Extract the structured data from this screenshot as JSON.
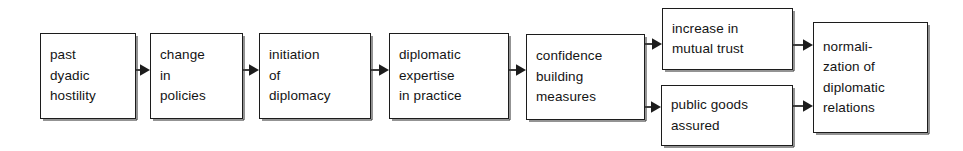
{
  "diagram": {
    "type": "flowchart",
    "orientation": "left-to-right",
    "background_color": "#ffffff",
    "stroke_color": "#1c1c1c",
    "text_color": "#141414",
    "nodes": [
      {
        "id": "past-dyadic-hostility",
        "lines": [
          "past",
          "dyadic",
          "hostility"
        ],
        "x": 40,
        "y": 33,
        "w": 96,
        "h": 86
      },
      {
        "id": "change-in-policies",
        "lines": [
          "change",
          "in",
          "policies"
        ],
        "x": 150,
        "y": 33,
        "w": 93,
        "h": 86
      },
      {
        "id": "initiation-of-diplomacy",
        "lines": [
          "initiation",
          "of",
          "diplomacy"
        ],
        "x": 259,
        "y": 33,
        "w": 112,
        "h": 86
      },
      {
        "id": "diplomatic-expertise-in-practice",
        "lines": [
          "diplomatic",
          "expertise",
          "in practice"
        ],
        "x": 389,
        "y": 33,
        "w": 120,
        "h": 86
      },
      {
        "id": "confidence-building-measures",
        "lines": [
          "confidence",
          "building",
          "measures"
        ],
        "x": 526,
        "y": 34,
        "w": 119,
        "h": 86
      },
      {
        "id": "increase-in-mutual-trust",
        "lines": [
          "increase in",
          "mutual trust"
        ],
        "x": 662,
        "y": 8,
        "w": 131,
        "h": 62
      },
      {
        "id": "public-goods-assured",
        "lines": [
          "public goods",
          "assured"
        ],
        "x": 661,
        "y": 85,
        "w": 132,
        "h": 61
      },
      {
        "id": "normalization-of-diplomatic-relations",
        "lines": [
          "normali-",
          "zation of",
          "diplomatic",
          "relations"
        ],
        "x": 813,
        "y": 22,
        "w": 115,
        "h": 111
      }
    ],
    "connectors": [
      {
        "id": "arrow-hostility-to-policies",
        "from": "past-dyadic-hostility",
        "to": "change-in-policies",
        "x": 136,
        "y": 70,
        "length": 14
      },
      {
        "id": "arrow-policies-to-initiation",
        "from": "change-in-policies",
        "to": "initiation-of-diplomacy",
        "x": 243,
        "y": 70,
        "length": 16
      },
      {
        "id": "arrow-initiation-to-expertise",
        "from": "initiation-of-diplomacy",
        "to": "diplomatic-expertise-in-practice",
        "x": 371,
        "y": 70,
        "length": 18
      },
      {
        "id": "arrow-expertise-to-confidence",
        "from": "diplomatic-expertise-in-practice",
        "to": "confidence-building-measures",
        "x": 509,
        "y": 70,
        "length": 17
      },
      {
        "id": "arrow-confidence-to-trust",
        "from": "confidence-building-measures",
        "to": "increase-in-mutual-trust",
        "x": 645,
        "y": 44,
        "length": 17
      },
      {
        "id": "arrow-confidence-to-goods",
        "from": "confidence-building-measures",
        "to": "public-goods-assured",
        "x": 645,
        "y": 107,
        "length": 16
      },
      {
        "id": "arrow-trust-to-normalization",
        "from": "increase-in-mutual-trust",
        "to": "normalization-of-diplomatic-relations",
        "x": 793,
        "y": 45,
        "length": 20
      },
      {
        "id": "arrow-goods-to-normalization",
        "from": "public-goods-assured",
        "to": "normalization-of-diplomatic-relations",
        "x": 793,
        "y": 106,
        "length": 20
      }
    ]
  }
}
